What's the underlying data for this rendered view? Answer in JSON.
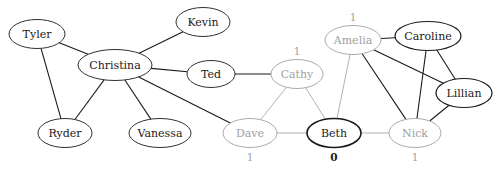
{
  "figure": {
    "width": 504,
    "height": 169,
    "background": "#ffffff"
  },
  "colors": {
    "dark": "#1a1a1a",
    "gray": "#a0a0a0",
    "edge_dark": "#1a1a1a",
    "edge_gray": "#a8a8a8",
    "background": "#ffffff"
  },
  "chart_data": {
    "type": "graph",
    "layout": "force-directed",
    "nodes": [
      {
        "id": "tyler",
        "label": "Tyler",
        "x": 37,
        "y": 34,
        "rx": 28,
        "ry": 14.5,
        "style": "dark",
        "stroke_width": 0.9,
        "value": null,
        "value_pos": null
      },
      {
        "id": "kevin",
        "label": "Kevin",
        "x": 203,
        "y": 22,
        "rx": 27,
        "ry": 14.5,
        "style": "dark",
        "stroke_width": 0.9,
        "value": null,
        "value_pos": null
      },
      {
        "id": "christina",
        "label": "Christina",
        "x": 115,
        "y": 65,
        "rx": 37,
        "ry": 15.5,
        "style": "dark",
        "stroke_width": 0.9,
        "value": null,
        "value_pos": null
      },
      {
        "id": "ted",
        "label": "Ted",
        "x": 211,
        "y": 74,
        "rx": 24,
        "ry": 13.5,
        "style": "dark",
        "stroke_width": 0.9,
        "value": null,
        "value_pos": null
      },
      {
        "id": "ryder",
        "label": "Ryder",
        "x": 65,
        "y": 133,
        "rx": 27,
        "ry": 14.5,
        "style": "dark",
        "stroke_width": 0.9,
        "value": null,
        "value_pos": null
      },
      {
        "id": "vanessa",
        "label": "Vanessa",
        "x": 160,
        "y": 133,
        "rx": 31,
        "ry": 14.5,
        "style": "dark",
        "stroke_width": 0.9,
        "value": null,
        "value_pos": null
      },
      {
        "id": "cathy",
        "label": "Cathy",
        "x": 297,
        "y": 74,
        "rx": 26,
        "ry": 14.5,
        "style": "gray",
        "stroke_width": 0.9,
        "value": "1",
        "value_pos": "above"
      },
      {
        "id": "amelia",
        "label": "Amelia",
        "x": 353,
        "y": 40,
        "rx": 28,
        "ry": 14.5,
        "style": "gray",
        "stroke_width": 0.9,
        "value": "1",
        "value_pos": "above"
      },
      {
        "id": "caroline",
        "label": "Caroline",
        "x": 428,
        "y": 36,
        "rx": 33,
        "ry": 14.5,
        "style": "dark",
        "stroke_width": 1.2,
        "value": null,
        "value_pos": null
      },
      {
        "id": "lillian",
        "label": "Lillian",
        "x": 464,
        "y": 93,
        "rx": 28,
        "ry": 14.5,
        "style": "dark",
        "stroke_width": 1.2,
        "value": null,
        "value_pos": null
      },
      {
        "id": "dave",
        "label": "Dave",
        "x": 250,
        "y": 133,
        "rx": 27,
        "ry": 14.5,
        "style": "gray",
        "stroke_width": 0.9,
        "value": "1",
        "value_pos": "below"
      },
      {
        "id": "beth",
        "label": "Beth",
        "x": 334,
        "y": 133,
        "rx": 27,
        "ry": 14.5,
        "style": "dark",
        "stroke_width": 1.6,
        "value": "0",
        "value_pos": "below",
        "value_bold": true
      },
      {
        "id": "nick",
        "label": "Nick",
        "x": 415,
        "y": 133,
        "rx": 26,
        "ry": 14.5,
        "style": "gray",
        "stroke_width": 0.9,
        "value": "1",
        "value_pos": "below"
      }
    ],
    "edges": [
      {
        "source": "tyler",
        "target": "christina",
        "style": "dark"
      },
      {
        "source": "tyler",
        "target": "ryder",
        "style": "dark"
      },
      {
        "source": "christina",
        "target": "kevin",
        "style": "dark"
      },
      {
        "source": "christina",
        "target": "ted",
        "style": "dark"
      },
      {
        "source": "christina",
        "target": "ryder",
        "style": "dark"
      },
      {
        "source": "christina",
        "target": "vanessa",
        "style": "dark"
      },
      {
        "source": "christina",
        "target": "dave",
        "style": "dark"
      },
      {
        "source": "ted",
        "target": "cathy",
        "style": "dark"
      },
      {
        "source": "cathy",
        "target": "dave",
        "style": "gray"
      },
      {
        "source": "cathy",
        "target": "beth",
        "style": "gray"
      },
      {
        "source": "dave",
        "target": "beth",
        "style": "gray"
      },
      {
        "source": "amelia",
        "target": "beth",
        "style": "gray"
      },
      {
        "source": "amelia",
        "target": "caroline",
        "style": "dark"
      },
      {
        "source": "amelia",
        "target": "nick",
        "style": "dark"
      },
      {
        "source": "amelia",
        "target": "lillian",
        "style": "dark"
      },
      {
        "source": "caroline",
        "target": "lillian",
        "style": "dark"
      },
      {
        "source": "caroline",
        "target": "nick",
        "style": "dark"
      },
      {
        "source": "beth",
        "target": "nick",
        "style": "gray"
      },
      {
        "source": "nick",
        "target": "lillian",
        "style": "dark"
      }
    ],
    "node_labels": [
      "Tyler",
      "Kevin",
      "Christina",
      "Ted",
      "Ryder",
      "Vanessa",
      "Cathy",
      "Amelia",
      "Caroline",
      "Lillian",
      "Dave",
      "Beth",
      "Nick"
    ],
    "value_annotations": [
      {
        "node": "cathy",
        "value": "1"
      },
      {
        "node": "amelia",
        "value": "1"
      },
      {
        "node": "dave",
        "value": "1"
      },
      {
        "node": "beth",
        "value": "0"
      },
      {
        "node": "nick",
        "value": "1"
      }
    ]
  }
}
